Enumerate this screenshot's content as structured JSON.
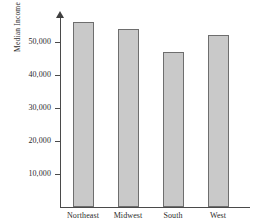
{
  "figure": {
    "part_label": ")",
    "background_color": "#ffffff"
  },
  "chart_data": {
    "type": "bar",
    "title": "",
    "xlabel": "",
    "ylabel": "Median Income",
    "categories": [
      "Northeast",
      "Midwest",
      "South",
      "West"
    ],
    "values": [
      56000,
      54000,
      47000,
      52000
    ],
    "ylim": [
      0,
      57000
    ],
    "yticks": [
      10000,
      20000,
      30000,
      40000,
      50000
    ],
    "ytick_labels": [
      "10,000",
      "20,000",
      "30,000",
      "40,000",
      "50,000"
    ],
    "grid": false,
    "legend": null,
    "bar_color": "#c9c9c9",
    "bar_edge_color": "#6e6e6e",
    "axis_color": "#4a4a4a"
  }
}
